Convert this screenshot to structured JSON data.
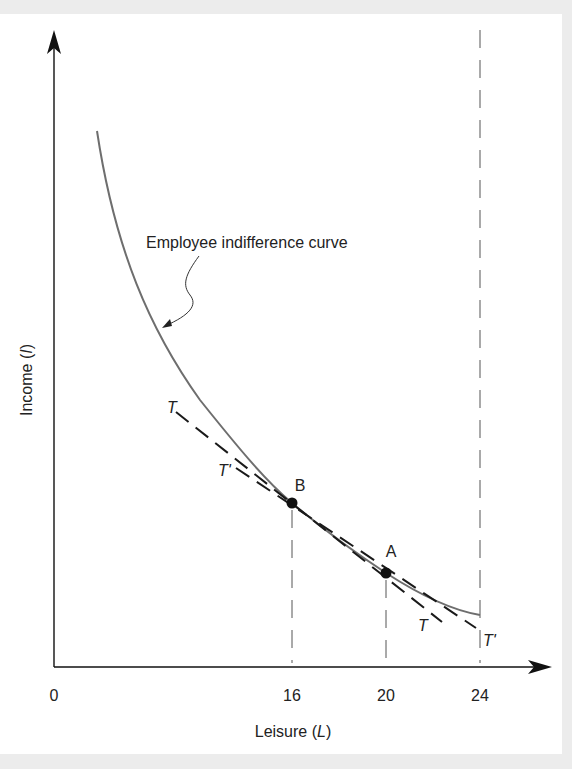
{
  "figure": {
    "annotation": "Employee indifference curve",
    "x_axis_label_prefix": "Leisure (",
    "x_axis_label_var": "L",
    "x_axis_label_suffix": ")",
    "y_axis_label_prefix": "Income (",
    "y_axis_label_var": "I",
    "y_axis_label_suffix": ")",
    "origin_label": "0",
    "x_ticks": [
      "16",
      "20",
      "24"
    ],
    "points": [
      {
        "label": "B",
        "leisure": 16
      },
      {
        "label": "A",
        "leisure": 20
      }
    ],
    "lines": {
      "T_upper": "T",
      "T_lower": "T",
      "Tprime_upper": "T'",
      "Tprime_lower": "T'"
    },
    "colors": {
      "axis": "#111111",
      "curve": "#6e6e6e",
      "dashed": "#1a1a1a",
      "background": "#ffffff",
      "frame": "#ececec"
    }
  }
}
